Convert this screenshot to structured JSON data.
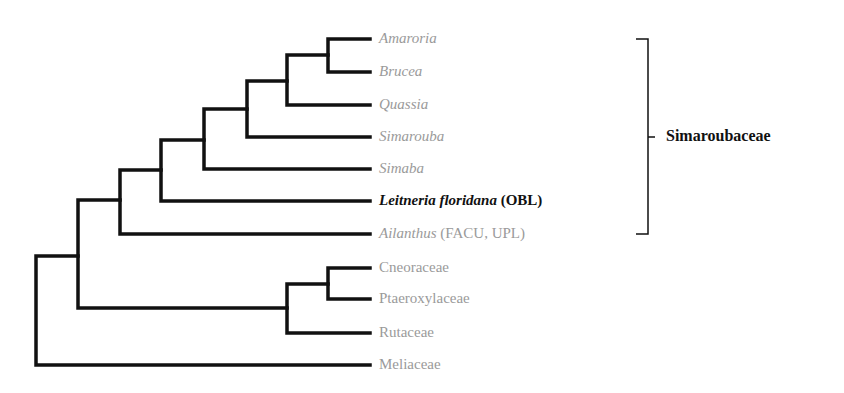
{
  "diagram": {
    "type": "phylogenetic-tree",
    "line_color": "#111111",
    "label_color": "#9a9a9a",
    "focus_color": "#111111",
    "taxa": [
      {
        "id": "amaroria",
        "name": "Amaroria",
        "suffix": "",
        "italic": true,
        "focus": false,
        "y": 39
      },
      {
        "id": "brucea",
        "name": "Brucea",
        "suffix": "",
        "italic": true,
        "focus": false,
        "y": 72
      },
      {
        "id": "quassia",
        "name": "Quassia",
        "suffix": "",
        "italic": true,
        "focus": false,
        "y": 105
      },
      {
        "id": "simarouba",
        "name": "Simarouba",
        "suffix": "",
        "italic": true,
        "focus": false,
        "y": 137
      },
      {
        "id": "simaba",
        "name": "Simaba",
        "suffix": "",
        "italic": true,
        "focus": false,
        "y": 169
      },
      {
        "id": "leitneria",
        "name": "Leitneria floridana",
        "suffix": " (OBL)",
        "italic": true,
        "focus": true,
        "y": 201
      },
      {
        "id": "ailanthus",
        "name": "Ailanthus",
        "suffix": " (FACU, UPL)",
        "italic": true,
        "focus": false,
        "y": 234
      },
      {
        "id": "cneoraceae",
        "name": "Cneoraceae",
        "suffix": "",
        "italic": false,
        "focus": false,
        "y": 268
      },
      {
        "id": "ptaeroxylaceae",
        "name": "Ptaeroxylaceae",
        "suffix": "",
        "italic": false,
        "focus": false,
        "y": 299
      },
      {
        "id": "rutaceae",
        "name": "Rutaceae",
        "suffix": "",
        "italic": false,
        "focus": false,
        "y": 333
      },
      {
        "id": "meliaceae",
        "name": "Meliaceae",
        "suffix": "",
        "italic": false,
        "focus": false,
        "y": 365
      }
    ],
    "group": {
      "label": "Simaroubaceae",
      "from": "amaroria",
      "to": "ailanthus"
    }
  }
}
